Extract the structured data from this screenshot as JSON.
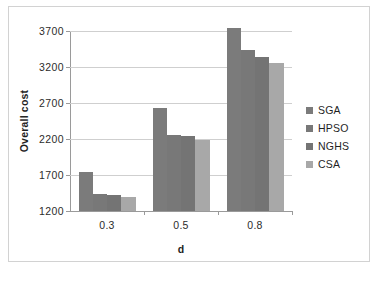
{
  "chart_data": {
    "type": "bar",
    "title": "",
    "xlabel": "d",
    "ylabel": "Overall cost",
    "categories": [
      "0.3",
      "0.5",
      "0.8"
    ],
    "ylim": [
      1200,
      3700
    ],
    "yticks": [
      1200,
      1700,
      2200,
      2700,
      3200,
      3700
    ],
    "ytick_labels": [
      "1200",
      "1700",
      "2200",
      "2700",
      "3200",
      "3700"
    ],
    "grid": true,
    "legend_position": "right",
    "series": [
      {
        "name": "SGA",
        "color": "#7b7b7b",
        "values": [
          1740,
          2630,
          3740
        ]
      },
      {
        "name": "HPSO",
        "color": "#787878",
        "values": [
          1440,
          2260,
          3430
        ]
      },
      {
        "name": "NGHS",
        "color": "#747474",
        "values": [
          1420,
          2240,
          3340
        ]
      },
      {
        "name": "CSA",
        "color": "#a8a8a8",
        "values": [
          1400,
          2190,
          3250
        ]
      }
    ]
  },
  "legend": {
    "items": [
      {
        "label": "SGA"
      },
      {
        "label": "HPSO"
      },
      {
        "label": "NGHS"
      },
      {
        "label": "CSA"
      }
    ]
  },
  "axes": {
    "y_title": "Overall cost",
    "x_title": "d"
  }
}
